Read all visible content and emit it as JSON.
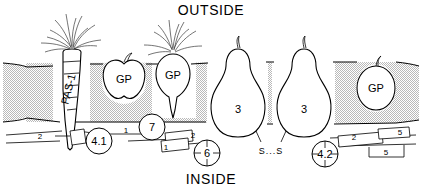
{
  "figure": {
    "title_top": "OUTSIDE",
    "title_bottom": "INSIDE",
    "membrane": {
      "name": "membrane-band",
      "fill_pattern": "stipple",
      "pattern_color": "#b9b9b9",
      "background_color": "#ffffff",
      "line_color": "#000000"
    },
    "organelles": [
      {
        "id": "pas1",
        "shape": "carrot",
        "label": "PAS-1",
        "rotated": true
      },
      {
        "id": "gp-left",
        "shape": "apple",
        "label": "GP",
        "rotated": false
      },
      {
        "id": "gp-mid",
        "shape": "beet",
        "label": "GP",
        "rotated": false
      },
      {
        "id": "pear-left",
        "shape": "pear",
        "label": "3",
        "rotated": false
      },
      {
        "id": "pear-right",
        "shape": "pear",
        "label": "3",
        "rotated": false
      },
      {
        "id": "gp-right",
        "shape": "egg",
        "label": "GP",
        "rotated": false
      }
    ],
    "circle_callouts": [
      {
        "id": "c41",
        "label": "4.1",
        "crosshair": false
      },
      {
        "id": "c7",
        "label": "7",
        "crosshair": false
      },
      {
        "id": "c6",
        "label": "6",
        "crosshair": true
      },
      {
        "id": "c42",
        "label": "4.2",
        "crosshair": true
      }
    ],
    "band_labels": [
      {
        "id": "b2-left",
        "label": "2"
      },
      {
        "id": "b1-left",
        "label": "1"
      },
      {
        "id": "b2-mid",
        "label": "2"
      },
      {
        "id": "b5-mid",
        "label": "5"
      },
      {
        "id": "b1-right",
        "label": "1"
      },
      {
        "id": "b2-right",
        "label": "2"
      },
      {
        "id": "b5-right",
        "label": "5"
      }
    ],
    "bond_label": "S...S"
  }
}
